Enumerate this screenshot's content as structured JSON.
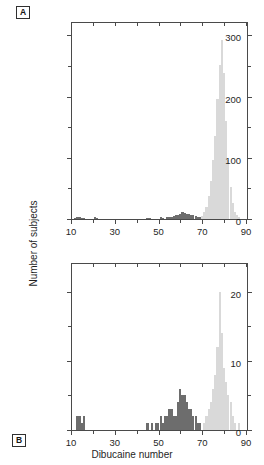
{
  "figure": {
    "xlabel": "Dibucaine number",
    "ylabel": "Number of subjects",
    "panel_a_label": "A",
    "panel_b_label": "B",
    "colors": {
      "normal_bar": "#d9d9d9",
      "atypical_bar": "#6d6d6d",
      "axis": "#4a4a4a",
      "text": "#1f1f1f",
      "background": "#ffffff"
    }
  },
  "chart_data": [
    {
      "type": "bar",
      "panel": "A",
      "title": "",
      "xlabel": "Dibucaine number",
      "ylabel": "Number of subjects",
      "xlim": [
        10,
        90
      ],
      "ylim": [
        0,
        320
      ],
      "xticks": [
        10,
        30,
        50,
        70,
        90
      ],
      "xticks_minor": [
        20,
        40,
        60,
        80
      ],
      "yticks": [
        0,
        100,
        200,
        300
      ],
      "yticks_minor": [
        50,
        150,
        250
      ],
      "grid": false,
      "legend": "none",
      "bin_width": 1,
      "series": [
        {
          "name": "atypical",
          "color": "#6d6d6d",
          "x": [
            11,
            12,
            13,
            14,
            15,
            20,
            21,
            44,
            45,
            50,
            51,
            53,
            54,
            55,
            56,
            57,
            58,
            59,
            60,
            61,
            62,
            63,
            64,
            65,
            66,
            67,
            68,
            69
          ],
          "values": [
            2,
            3,
            3,
            2,
            2,
            3,
            2,
            2,
            2,
            3,
            2,
            4,
            3,
            4,
            5,
            6,
            7,
            9,
            11,
            10,
            8,
            9,
            6,
            7,
            5,
            4,
            3,
            2
          ]
        },
        {
          "name": "normal",
          "color": "#d9d9d9",
          "x": [
            69,
            70,
            71,
            72,
            73,
            74,
            75,
            76,
            77,
            78,
            79,
            80,
            81,
            82,
            83,
            84,
            85,
            86
          ],
          "values": [
            5,
            11,
            20,
            38,
            62,
            96,
            135,
            196,
            252,
            293,
            238,
            160,
            96,
            52,
            26,
            12,
            6,
            3
          ]
        }
      ]
    },
    {
      "type": "bar",
      "panel": "B",
      "title": "",
      "xlabel": "Dibucaine number",
      "ylabel": "Number of subjects",
      "xlim": [
        10,
        90
      ],
      "ylim": [
        0,
        24
      ],
      "xticks": [
        10,
        30,
        50,
        70,
        90
      ],
      "xticks_minor": [
        20,
        40,
        60,
        80
      ],
      "yticks": [
        0,
        10,
        20
      ],
      "yticks_minor": [
        5,
        15
      ],
      "grid": false,
      "legend": "none",
      "bin_width": 1,
      "series": [
        {
          "name": "atypical",
          "color": "#6d6d6d",
          "x": [
            12,
            13,
            14,
            15,
            44,
            46,
            48,
            49,
            50,
            51,
            52,
            53,
            54,
            55,
            56,
            57,
            58,
            59,
            60,
            61,
            62,
            63,
            64,
            65,
            66,
            67,
            68
          ],
          "values": [
            2,
            2,
            1,
            2,
            1,
            1,
            1,
            1,
            2,
            1,
            2,
            2,
            3,
            3,
            2,
            2,
            4,
            6,
            5,
            5,
            4,
            3,
            3,
            2,
            2,
            1,
            1
          ]
        },
        {
          "name": "normal",
          "color": "#d9d9d9",
          "x": [
            70,
            71,
            72,
            73,
            74,
            75,
            76,
            77,
            78,
            79,
            80,
            81,
            82,
            83,
            84,
            86
          ],
          "values": [
            1,
            2,
            3,
            4,
            6,
            8,
            12,
            20,
            14,
            9,
            7,
            5,
            4,
            2,
            1,
            1
          ]
        }
      ]
    }
  ]
}
